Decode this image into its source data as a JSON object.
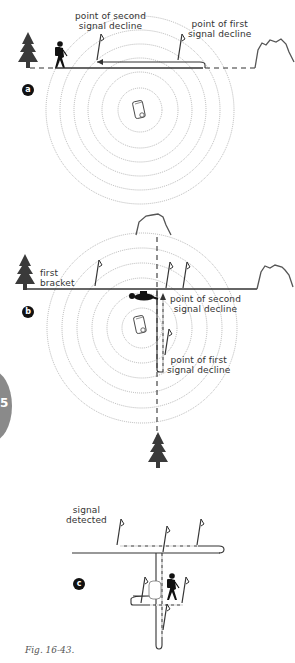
{
  "figure": {
    "caption": "Fig. 16-43.",
    "chapter_tab": "5"
  },
  "panels": {
    "a": {
      "badge": "a",
      "labels": {
        "second_decline": [
          "point of second",
          "signal decline"
        ],
        "first_decline": [
          "point of first",
          "signal decline"
        ]
      }
    },
    "b": {
      "badge": "b",
      "labels": {
        "first_bracket": [
          "first",
          "bracket"
        ],
        "second_decline": [
          "point of second",
          "signal decline"
        ],
        "first_decline": [
          "point of first",
          "signal decline"
        ]
      }
    },
    "c": {
      "badge": "c",
      "labels": {
        "signal_detected": [
          "signal",
          "detected"
        ]
      }
    }
  },
  "colors": {
    "line": "#333333",
    "circle": "#9a9a9a",
    "tree": "#3a3a3a",
    "tab": "#8a8a8a"
  }
}
